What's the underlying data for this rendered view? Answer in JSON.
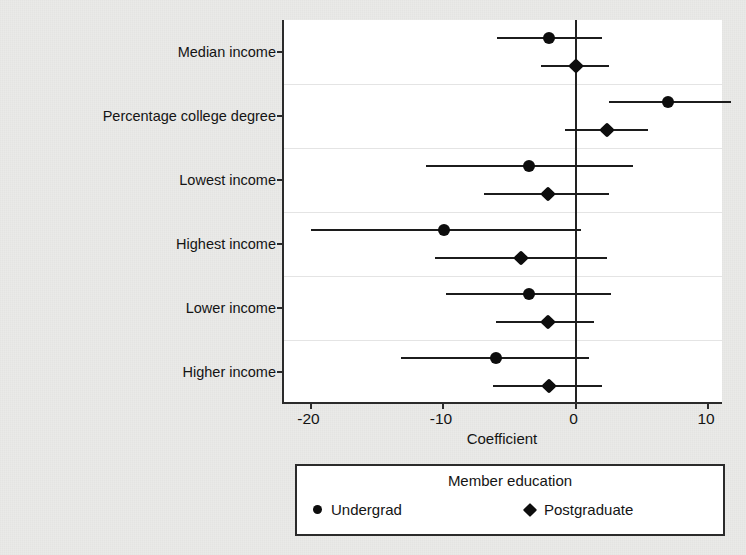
{
  "chart_data": {
    "type": "scatter",
    "title": "",
    "xlabel": "Coefficient",
    "ylabel": "Constituent attributes",
    "xlim": [
      -22,
      11.2
    ],
    "xticks": [
      -20,
      -10,
      0,
      10
    ],
    "xtick_labels": [
      "-20",
      "-10",
      "0",
      "10"
    ],
    "grid": false,
    "zero_reference_line": 0,
    "legend": {
      "title": "Member education",
      "position": "below-axis",
      "entries": [
        {
          "label": "Undergrad",
          "marker": "circle"
        },
        {
          "label": "Postgraduate",
          "marker": "diamond"
        }
      ]
    },
    "categories": [
      "Median income",
      "Percentage college degree",
      "Lowest income",
      "Highest income",
      "Lower income",
      "Higher income"
    ],
    "series": [
      {
        "name": "Undergrad",
        "marker": "circle",
        "values": [
          -2.0,
          7.0,
          -3.5,
          -9.9,
          -3.5,
          -6.0
        ],
        "ci_low": [
          -5.9,
          2.5,
          -11.3,
          -20.0,
          -9.8,
          -13.2
        ],
        "ci_high": [
          2.0,
          11.7,
          4.3,
          0.4,
          2.7,
          1.0
        ]
      },
      {
        "name": "Postgraduate",
        "marker": "diamond",
        "values": [
          0.0,
          2.4,
          -2.1,
          -4.1,
          -2.1,
          -2.0
        ],
        "ci_low": [
          -2.6,
          -0.8,
          -6.9,
          -10.6,
          -6.0,
          -6.2
        ],
        "ci_high": [
          2.5,
          5.5,
          2.5,
          2.4,
          1.4,
          2.0
        ]
      }
    ],
    "colors": {
      "marker": "#0d0d0d",
      "interval": "#1c1c1c",
      "axis": "#2b2b2b",
      "plot_background": "#ffffff",
      "page_background": "#eaeae8"
    }
  }
}
